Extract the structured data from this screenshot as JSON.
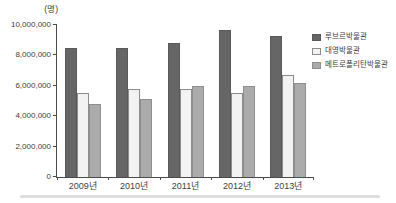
{
  "chart_data": {
    "type": "bar",
    "title": "",
    "unit_label": "(명)",
    "xlabel": "",
    "ylabel": "(명)",
    "categories": [
      "2009년",
      "2010년",
      "2011년",
      "2012년",
      "2013년"
    ],
    "series": [
      {
        "name": "루브르박물관",
        "color": "#666666",
        "border_color": "#595959",
        "values": [
          8500000,
          8500000,
          8800000,
          9700000,
          9300000
        ]
      },
      {
        "name": "대영박물관",
        "color": "#f2f2f2",
        "border_color": "#8c8c8c",
        "values": [
          5500000,
          5800000,
          5800000,
          5500000,
          6700000
        ]
      },
      {
        "name": "메트로폴리탄박물관",
        "color": "#ababab",
        "border_color": "#8f8f8f",
        "values": [
          4800000,
          5100000,
          6000000,
          6000000,
          6200000
        ]
      }
    ],
    "ylim": [
      0,
      10000000
    ],
    "y_tick_step": 2000000,
    "y_tick_labels": [
      "0",
      "2,000,000",
      "4,000,000",
      "6,000,000",
      "8,000,000",
      "10,000,000"
    ],
    "grid": false,
    "legend_position": "right",
    "axis_color": "#4a4a4a",
    "text_color": "#404040",
    "separator_color": "#dedede"
  }
}
